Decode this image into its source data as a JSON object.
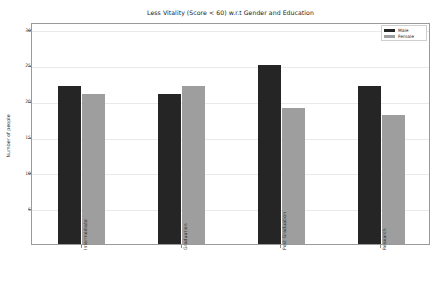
{
  "chart_data": {
    "type": "bar",
    "title": "Less Vitality (Score < 60) w.r.t Gender and Education",
    "xlabel": "",
    "ylabel": "Number of people",
    "categories": [
      "Intermediate",
      "Graduation",
      "Post Graduation",
      "Research"
    ],
    "series": [
      {
        "name": "Male",
        "color": "#252525",
        "values": [
          22,
          21,
          25,
          22
        ]
      },
      {
        "name": "Female",
        "color": "#9e9e9e",
        "values": [
          21,
          22,
          19,
          18
        ]
      }
    ],
    "ylim": [
      0,
      31
    ],
    "yticks": [
      5,
      10,
      15,
      20,
      25,
      30
    ],
    "ytick_labels": [
      "5",
      "10",
      "15",
      "20",
      "25",
      "30"
    ],
    "grid": true,
    "legend_position": "upper right"
  },
  "legend": {
    "items": [
      {
        "label": "Male"
      },
      {
        "label": "Female"
      }
    ]
  }
}
